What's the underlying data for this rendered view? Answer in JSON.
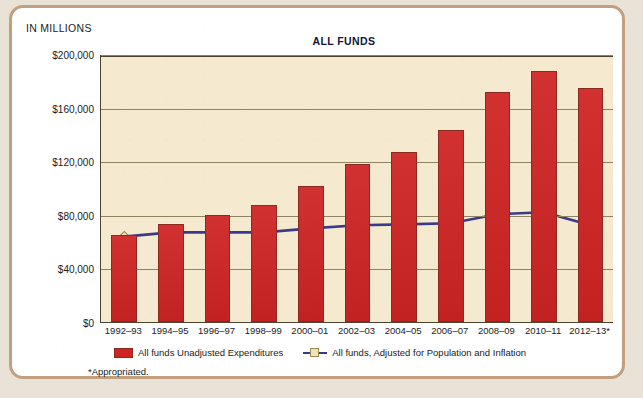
{
  "figure": {
    "title": "ALL FUNDS",
    "axis_note": "IN MILLIONS",
    "footnote": "*Appropriated."
  },
  "legend": {
    "items": [
      {
        "label": "All funds Unadjusted Expenditures",
        "marker": "red-square-swatch",
        "color": "#cf2424"
      },
      {
        "label": "All funds, Adjusted for Population and Inflation",
        "marker": "line-with-square-marker",
        "color": "#3a3a8c"
      }
    ]
  },
  "yaxis": {
    "ticks": [
      "$200,000",
      "$160,000",
      "$120,000",
      "$80,000",
      "$40,000",
      "$0"
    ]
  },
  "colors": {
    "bar": "#cf2424",
    "bar_edge": "#8d2a20",
    "line": "#3a3a8c",
    "marker_fill": "#f2e2b8",
    "marker_edge": "#9a8a52",
    "plot_bg": "#f5ead0",
    "card_border": "#c29f7e",
    "grid": "#8e8360"
  },
  "chart_data": {
    "type": "bar",
    "title": "ALL FUNDS",
    "xlabel": "",
    "ylabel": "IN MILLIONS",
    "ylim": [
      0,
      200000
    ],
    "ytick_values": [
      0,
      40000,
      80000,
      120000,
      160000,
      200000
    ],
    "grid": true,
    "legend_position": "bottom",
    "categories": [
      "1992–93",
      "1994–95",
      "1996–97",
      "1998–99",
      "2000–01",
      "2002–03",
      "2004–05",
      "2006–07",
      "2008–09",
      "2010–11",
      "2012–13*"
    ],
    "series": [
      {
        "name": "All funds Unadjusted Expenditures",
        "type": "bar",
        "values": [
          65300,
          72900,
          80000,
          87300,
          101700,
          117600,
          126800,
          143500,
          171700,
          187600,
          174600
        ]
      },
      {
        "name": "All funds, Adjusted for Population and Inflation",
        "type": "line",
        "values": [
          64500,
          67600,
          67600,
          67600,
          70600,
          72900,
          73600,
          74400,
          81200,
          82700,
          72900
        ]
      }
    ],
    "annotations": [
      "*Appropriated."
    ]
  }
}
